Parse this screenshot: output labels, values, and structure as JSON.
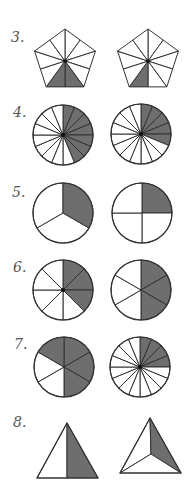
{
  "colors": {
    "stroke": "#333333",
    "shade": "#6e6e6e",
    "fill": "#ffffff",
    "label": "#555555"
  },
  "problems": [
    {
      "number": "3.",
      "label_pos": [
        11,
        29
      ],
      "figures": [
        {
          "type": "pentagon",
          "cx": 65,
          "cy": 61,
          "r": 32,
          "parts": 10,
          "shaded": [
            4,
            5
          ]
        },
        {
          "type": "pentagon",
          "cx": 148,
          "cy": 61,
          "r": 32,
          "parts": 10,
          "shaded": [
            5
          ]
        }
      ]
    },
    {
      "number": "4.",
      "label_pos": [
        13,
        104
      ],
      "figures": [
        {
          "type": "circle",
          "cx": 63,
          "cy": 135,
          "r": 30,
          "parts": 16,
          "start": 0,
          "shaded": [
            0,
            1,
            2,
            3,
            4,
            5,
            6
          ]
        },
        {
          "type": "circle",
          "cx": 141,
          "cy": 134,
          "r": 30,
          "parts": 16,
          "start": 0,
          "shaded": [
            0,
            1,
            2,
            3,
            4
          ]
        }
      ]
    },
    {
      "number": "5.",
      "label_pos": [
        12,
        184
      ],
      "figures": [
        {
          "type": "circle",
          "cx": 63,
          "cy": 213,
          "r": 30,
          "parts": 3,
          "start": 120,
          "shaded": [
            2
          ]
        },
        {
          "type": "circle",
          "cx": 142,
          "cy": 213,
          "r": 30,
          "parts": 4,
          "start": 0,
          "shaded": [
            0
          ]
        }
      ]
    },
    {
      "number": "6.",
      "label_pos": [
        13,
        259
      ],
      "figures": [
        {
          "type": "circle",
          "cx": 63,
          "cy": 290,
          "r": 30,
          "parts": 8,
          "start": 0,
          "shaded": [
            0,
            1,
            2
          ]
        },
        {
          "type": "circle",
          "cx": 141,
          "cy": 290,
          "r": 30,
          "parts": 6,
          "start": 0,
          "shaded": [
            0,
            1,
            2
          ]
        }
      ]
    },
    {
      "number": "7.",
      "label_pos": [
        14,
        336
      ],
      "figures": [
        {
          "type": "circle",
          "cx": 64,
          "cy": 367,
          "r": 30,
          "parts": 6,
          "start": 0,
          "shaded": [
            0,
            1,
            2,
            5
          ]
        },
        {
          "type": "circle",
          "cx": 140,
          "cy": 367,
          "r": 30,
          "parts": 16,
          "start": 0,
          "shaded": [
            0,
            1,
            2,
            3
          ]
        }
      ]
    },
    {
      "number": "8.",
      "label_pos": [
        13,
        414
      ],
      "figures": [
        {
          "type": "polygon-split",
          "shape": [
            [
              67,
              423
            ],
            [
              37,
              478
            ],
            [
              98,
              478
            ]
          ],
          "regions": [
            {
              "points": [
                [
                  67,
                  423
                ],
                [
                  37,
                  478
                ],
                [
                  67,
                  478
                ]
              ],
              "shaded": false
            },
            {
              "points": [
                [
                  67,
                  423
                ],
                [
                  67,
                  478
                ],
                [
                  98,
                  478
                ]
              ],
              "shaded": true
            }
          ]
        },
        {
          "type": "polygon-split",
          "shape": [
            [
              150,
              418
            ],
            [
              120,
              473
            ],
            [
              181,
              473
            ]
          ],
          "regions": [
            {
              "points": [
                [
                  150,
                  418
                ],
                [
                  120,
                  473
                ],
                [
                  151,
                  454
                ]
              ],
              "shaded": false
            },
            {
              "points": [
                [
                  150,
                  418
                ],
                [
                  151,
                  454
                ],
                [
                  181,
                  473
                ]
              ],
              "shaded": true
            },
            {
              "points": [
                [
                  120,
                  473
                ],
                [
                  181,
                  473
                ],
                [
                  151,
                  454
                ]
              ],
              "shaded": false
            }
          ]
        }
      ]
    }
  ]
}
